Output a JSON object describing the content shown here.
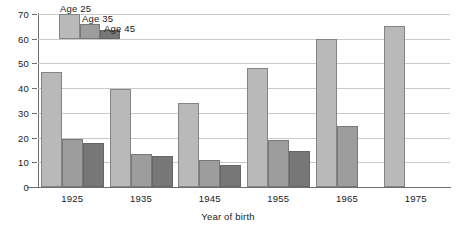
{
  "chart_data": {
    "type": "bar",
    "title": "",
    "subtitle": "",
    "xlabel": "Year of birth",
    "ylabel": "",
    "categories": [
      "1925",
      "1935",
      "1945",
      "1955",
      "1965",
      "1975"
    ],
    "series": [
      {
        "name": "Age 25",
        "color": "#b9b9b9",
        "values": [
          46.5,
          39.5,
          34,
          48,
          60,
          65
        ]
      },
      {
        "name": "Age 35",
        "color": "#9d9d9d",
        "values": [
          19.5,
          13.5,
          11,
          19,
          24.5,
          null
        ]
      },
      {
        "name": "Age 45",
        "color": "#777777",
        "values": [
          18,
          12.5,
          9,
          14.5,
          null,
          null
        ]
      }
    ],
    "ylim": [
      0,
      70
    ],
    "yticks": [
      0,
      10,
      20,
      30,
      40,
      50,
      60,
      70
    ],
    "ytick_labels": [
      "0",
      "10",
      "20",
      "30",
      "40",
      "50",
      "60",
      "70"
    ],
    "grid": true,
    "legend_position": "top-left-inside",
    "legend_entries": [
      "Age 25",
      "Age 35",
      "Age 45"
    ],
    "axis_color": "#6e6e6e",
    "grid_color": "#c9c9c9",
    "background": "#ffffff"
  }
}
